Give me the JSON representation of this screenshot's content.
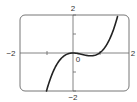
{
  "chart_data": {
    "type": "line",
    "title": "",
    "function": "y = x^3 - x^2",
    "xlabel": "",
    "ylabel": "",
    "xlim": [
      -2,
      2
    ],
    "ylim": [
      -2,
      2
    ],
    "x_tick_labels": {
      "left": "−2",
      "right": "2",
      "origin": "0"
    },
    "y_tick_labels": {
      "top": "2",
      "bottom": "−2"
    },
    "x_ticks": [
      -1,
      1
    ],
    "y_ticks": [
      -1,
      1
    ],
    "grid": false,
    "series": [
      {
        "name": "f(x)",
        "x": [
          -1.0,
          -0.8,
          -0.6,
          -0.4,
          -0.2,
          0.0,
          0.2,
          0.4,
          0.6,
          0.667,
          0.8,
          1.0,
          1.2,
          1.4,
          1.6,
          1.7
        ],
        "y": [
          -2.0,
          -1.152,
          -0.576,
          -0.224,
          -0.048,
          0.0,
          -0.032,
          -0.096,
          -0.144,
          -0.148,
          -0.128,
          0.0,
          0.288,
          0.784,
          1.536,
          2.023
        ]
      }
    ]
  },
  "labels": {
    "top": "2",
    "bottom": "−2",
    "left": "−2",
    "right": "2",
    "origin": "0"
  },
  "colors": {
    "curve": "#222222",
    "axis": "#666666",
    "frame": "#777777"
  }
}
